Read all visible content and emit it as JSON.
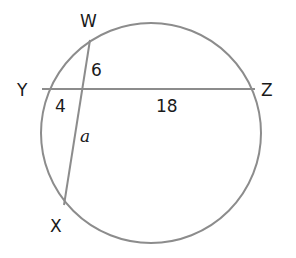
{
  "diagram": {
    "type": "intersecting-chords-in-circle",
    "circle": {
      "cx": 151,
      "cy": 133,
      "r": 110,
      "stroke": "#8c8c8c"
    },
    "points": {
      "W": {
        "label": "W",
        "x": 90,
        "y": 40
      },
      "Y": {
        "label": "Y",
        "x": 42,
        "y": 89
      },
      "Z": {
        "label": "Z",
        "x": 255,
        "y": 89
      },
      "X": {
        "label": "X",
        "x": 64,
        "y": 205
      }
    },
    "chords": [
      {
        "name": "WX",
        "from": "W",
        "to": "X"
      },
      {
        "name": "YZ",
        "from": "Y",
        "to": "Z"
      }
    ],
    "segment_labels": {
      "upper_WX": "6",
      "left_YZ": "4",
      "right_YZ": "18",
      "lower_WX": "a"
    }
  }
}
